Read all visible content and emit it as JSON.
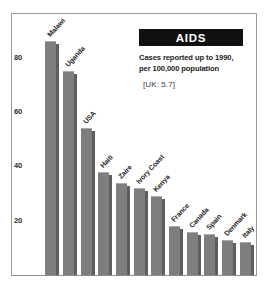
{
  "chart_data": {
    "type": "bar",
    "title": "AIDS",
    "subtitle_line1": "Cases reported up to 1990,",
    "subtitle_line2": "per 100,000 population",
    "annotation": "[UK: 5.7]",
    "xlabel": "",
    "ylabel": "",
    "ylim": [
      0,
      92
    ],
    "grid": false,
    "legend": null,
    "ytick_labels": [
      "20",
      "40",
      "60",
      "80"
    ],
    "ytick_values": [
      20,
      40,
      60,
      80
    ],
    "categories": [
      "Malawi",
      "Uganda",
      "USA",
      "Haiti",
      "Zaire",
      "Ivory Coast",
      "Kenya",
      "France",
      "Canada",
      "Spain",
      "Denmark",
      "Italy"
    ],
    "values": [
      86,
      75,
      54,
      38,
      34,
      32,
      29,
      18,
      16,
      15,
      13,
      12
    ],
    "bar_color": "#7e7e7e",
    "bar_shadow_color": "#5e5e5e",
    "title_box_color": "#101010",
    "title_text_color": "#ffffff",
    "background_color": "#ffffff",
    "frame_color": "#9a9a9a"
  }
}
